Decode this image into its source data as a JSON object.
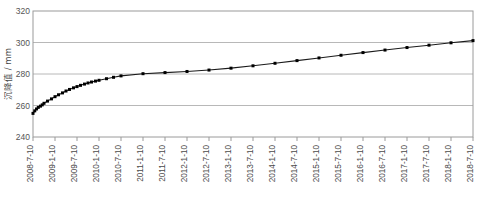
{
  "chart_data": {
    "type": "line",
    "title": "",
    "xlabel": "",
    "ylabel": "沉降值 / mm",
    "ylim": [
      240,
      320
    ],
    "yticks": [
      240,
      260,
      280,
      300,
      320
    ],
    "grid": true,
    "legend": "none",
    "marker": "square",
    "line_color": "#1a1a1a",
    "marker_color": "#000000",
    "grid_color": "#b8b8b8",
    "frame_color": "#9a9a9a",
    "xticklabels": [
      "2008-7-10",
      "2009-1-10",
      "2009-7-10",
      "2010-1-10",
      "2010-7-10",
      "2011-1-10",
      "2011-7-10",
      "2012-1-10",
      "2012-7-10",
      "2013-1-10",
      "2013-7-10",
      "2014-1-10",
      "2014-7-10",
      "2015-1-10",
      "2015-7-10",
      "2016-1-10",
      "2016-7-10",
      "2017-1-10",
      "2017-7-10",
      "2018-1-10",
      "2018-7-10"
    ],
    "xlim": [
      "2008-7-10",
      "2018-7-10"
    ],
    "series": [
      {
        "name": "沉降值",
        "x": [
          0.0,
          0.04,
          0.08,
          0.12,
          0.17,
          0.21,
          0.25,
          0.33,
          0.42,
          0.5,
          0.58,
          0.67,
          0.75,
          0.83,
          0.92,
          1.0,
          1.08,
          1.17,
          1.25,
          1.33,
          1.42,
          1.5,
          1.67,
          1.83,
          2.0,
          2.5,
          3.0,
          3.5,
          4.0,
          4.5,
          5.0,
          5.5,
          6.0,
          6.5,
          7.0,
          7.5,
          8.0,
          8.5,
          9.0,
          9.5,
          10.0
        ],
        "values": [
          255.0,
          256.6,
          257.8,
          258.8,
          259.6,
          260.4,
          261.4,
          262.8,
          264.2,
          265.6,
          266.8,
          268.0,
          269.2,
          270.2,
          271.2,
          272.0,
          272.8,
          273.6,
          274.3,
          274.9,
          275.5,
          276.0,
          277.0,
          277.9,
          278.8,
          280.2,
          280.9,
          281.6,
          282.5,
          283.7,
          285.2,
          286.8,
          288.5,
          290.2,
          291.9,
          293.6,
          295.2,
          296.8,
          298.3,
          299.8,
          301.2
        ]
      }
    ]
  }
}
